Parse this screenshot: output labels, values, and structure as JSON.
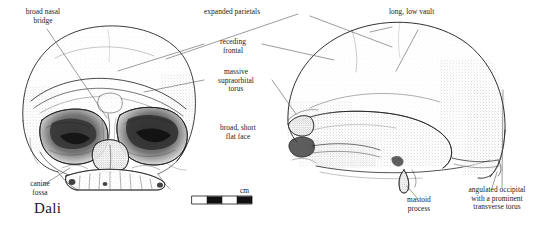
{
  "figure": {
    "specimen_name": "Dali",
    "view_left": "frontal view",
    "view_right": "lateral view (left-facing)",
    "background_color": "#ffffff",
    "ink_color": "#1a1a1a"
  },
  "scale_bar": {
    "unit_label": "cm",
    "segments": 4,
    "pattern": [
      "white",
      "black",
      "white",
      "black"
    ]
  },
  "annotations": [
    {
      "id": "broad-nasal-bridge",
      "text": "broad nasal\nbridge"
    },
    {
      "id": "expanded-parietals",
      "text": "expanded parietals"
    },
    {
      "id": "long-low-vault",
      "text": "long, low vault"
    },
    {
      "id": "receding-frontal",
      "text": "receding\nfrontal"
    },
    {
      "id": "massive-supraorbital-torus",
      "text": "massive\nsupraorbital\ntorus"
    },
    {
      "id": "broad-short-flat-face",
      "text": "broad, short\nflat face"
    },
    {
      "id": "canine-fossa",
      "text": "canine\nfossa"
    },
    {
      "id": "mastoid-process",
      "text": "mastoid\nprocess"
    },
    {
      "id": "angulated-occipital",
      "text": "angulated occipital\nwith a prominent\ntransverse torus"
    }
  ]
}
